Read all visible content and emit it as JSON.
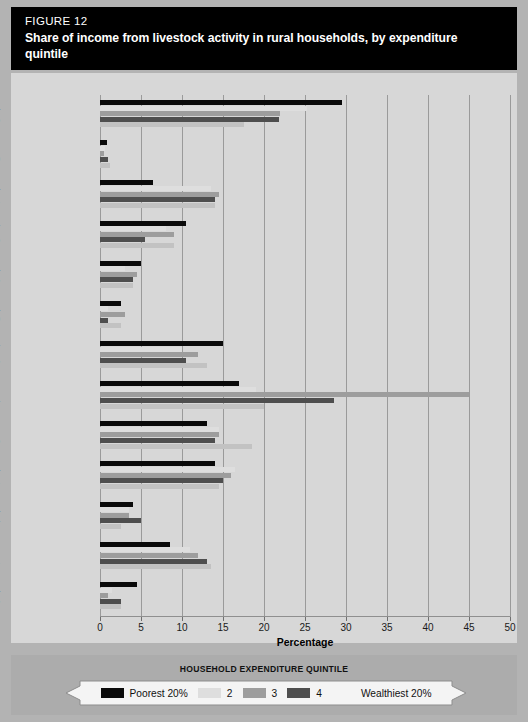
{
  "figure": {
    "number_label": "FIGURE 12",
    "title": "Share of income from livestock activity in rural households, by expenditure quintile"
  },
  "legend": {
    "caption": "HOUSEHOLD EXPENDITURE QUINTILE",
    "items": [
      {
        "label": "Poorest 20%",
        "color": "#0a0a0a"
      },
      {
        "label": "2",
        "color": "#dedede"
      },
      {
        "label": "3",
        "color": "#9d9d9d"
      },
      {
        "label": "4",
        "color": "#4e4e4e"
      },
      {
        "label": "Wealthiest 20%",
        "color": "#f4f4f4"
      }
    ]
  },
  "axis": {
    "xlabel": "Percentage",
    "ticklabels": [
      "0",
      "5",
      "10",
      "15",
      "20",
      "25",
      "30",
      "35",
      "40",
      "45",
      "50"
    ]
  },
  "chart_data": {
    "type": "bar",
    "orientation": "horizontal",
    "title": "Share of income from livestock activity in rural households, by expenditure quintile",
    "xlabel": "Percentage",
    "ylabel": "",
    "xlim": [
      0,
      50
    ],
    "xticks": [
      0,
      5,
      10,
      15,
      20,
      25,
      30,
      35,
      40,
      45,
      50
    ],
    "grid": "vertical",
    "legend_position": "bottom",
    "legend_title": "HOUSEHOLD EXPENDITURE QUINTILE",
    "categories": [
      "Albania 2005",
      "Bangladesh 2000",
      "Bulgaria 2001",
      "Ecuador 1995",
      "Ghana 1998",
      "Guatemala 2000",
      "Madagascar 1993",
      "Malawi 2004",
      "Nepal 1996",
      "Nicaragua 2001",
      "Nigeria 2004",
      "Pakistan 2001",
      "Panama 2003"
    ],
    "category_labels": [
      {
        "country": "Albania",
        "year": "2005"
      },
      {
        "country": "Bangladesh",
        "year": "2000"
      },
      {
        "country": "Bulgaria",
        "year": "2001"
      },
      {
        "country": "Ecuador",
        "year": "1995"
      },
      {
        "country": "Ghana",
        "year": "1998"
      },
      {
        "country": "Guatemala",
        "year": "2000"
      },
      {
        "country": "Madagascar",
        "year": "1993"
      },
      {
        "country": "Malawi",
        "year": "2004"
      },
      {
        "country": "Nepal",
        "year": "1996"
      },
      {
        "country": "Nicaragua",
        "year": "2001"
      },
      {
        "country": "Nigeria",
        "year": "2004"
      },
      {
        "country": "Pakistan",
        "year": "2001"
      },
      {
        "country": "Panama",
        "year": "2003"
      }
    ],
    "series": [
      {
        "name": "Poorest 20%",
        "color": "#0a0a0a",
        "values": [
          29.5,
          0.8,
          6.5,
          10.5,
          5.0,
          2.5,
          15.0,
          17.0,
          13.0,
          14.0,
          4.0,
          8.5,
          4.5
        ]
      },
      {
        "name": "2",
        "color": "#dedede",
        "values": [
          25.3,
          0.6,
          13.5,
          8.0,
          3.0,
          1.0,
          10.0,
          19.0,
          14.5,
          16.5,
          3.5,
          11.0,
          1.5
        ]
      },
      {
        "name": "3",
        "color": "#9d9d9d",
        "values": [
          22.0,
          0.5,
          14.5,
          9.0,
          4.5,
          3.0,
          12.0,
          45.0,
          14.5,
          16.0,
          3.5,
          12.0,
          1.0
        ]
      },
      {
        "name": "4",
        "color": "#4e4e4e",
        "values": [
          21.8,
          1.0,
          14.0,
          5.5,
          4.0,
          1.0,
          10.5,
          28.5,
          14.0,
          15.0,
          5.0,
          13.0,
          2.5
        ]
      },
      {
        "name": "Wealthiest 20%",
        "color": "#c2c2c2",
        "values": [
          17.5,
          1.2,
          14.0,
          9.0,
          4.0,
          2.5,
          13.0,
          20.0,
          18.5,
          14.5,
          2.5,
          13.5,
          2.5
        ]
      }
    ]
  }
}
